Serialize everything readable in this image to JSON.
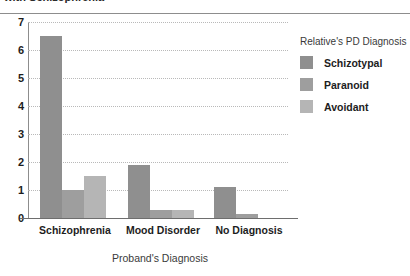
{
  "title": "with Schizophrenia",
  "chart_data": {
    "type": "bar",
    "title": "with Schizophrenia",
    "xlabel": "Proband's Diagnosis",
    "ylabel": "",
    "categories": [
      "Schizophrenia",
      "Mood Disorder",
      "No Diagnosis"
    ],
    "series": [
      {
        "name": "Schizotypal",
        "values": [
          6.5,
          1.9,
          1.1
        ],
        "color": "#8f8f8f"
      },
      {
        "name": "Paranoid",
        "values": [
          1.0,
          0.3,
          0.15
        ],
        "color": "#9e9e9e"
      },
      {
        "name": "Avoidant",
        "values": [
          1.5,
          0.3,
          0.0
        ],
        "color": "#b5b5b5"
      }
    ],
    "ylim": [
      0,
      7
    ],
    "yticks": [
      "0",
      "1",
      "2",
      "3",
      "4",
      "5",
      "6",
      "7"
    ],
    "grid": true,
    "legend_position": "right"
  },
  "legend": {
    "title": "Relative's PD Diagnosis"
  }
}
